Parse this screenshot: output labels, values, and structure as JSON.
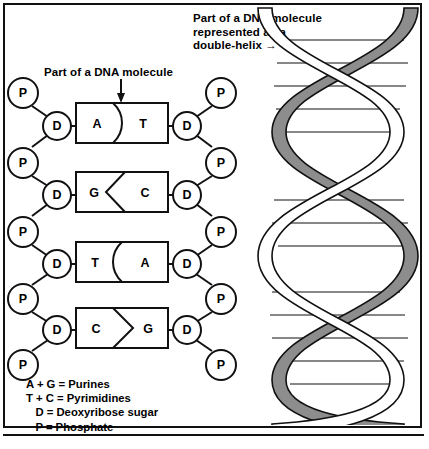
{
  "figure": {
    "title_helix": "Part of a DNA molecule\nrepresented as a\ndouble-helix   →",
    "title_ladder": "Part of a DNA molecule"
  },
  "legend": {
    "rows": [
      "A + G = Purines",
      "T + C = Pyrimidines",
      "   D = Deoxyribose sugar",
      "   P = Phosphate"
    ]
  },
  "ladder": {
    "base_pairs": [
      {
        "left": "A",
        "right": "T",
        "divider": "curve-right"
      },
      {
        "left": "G",
        "right": "C",
        "divider": "angle-left"
      },
      {
        "left": "T",
        "right": "A",
        "divider": "curve-left"
      },
      {
        "left": "C",
        "right": "G",
        "divider": "angle-right"
      }
    ],
    "backbone_left": [
      "P",
      "D",
      "P",
      "D",
      "P",
      "D",
      "P",
      "D",
      "P"
    ],
    "backbone_right": [
      "P",
      "D",
      "P",
      "D",
      "P",
      "D",
      "P",
      "D",
      "P"
    ],
    "node_labels": {
      "phosphate": "P",
      "sugar": "D"
    }
  },
  "helix": {
    "strand_front_color": "#ffffff",
    "strand_back_color": "#8d8d8d",
    "outline_color": "#111111",
    "rung_count": 13,
    "turns": 3
  },
  "colors": {
    "ink": "#111111",
    "paper": "#ffffff",
    "shade": "#8d8d8d"
  }
}
